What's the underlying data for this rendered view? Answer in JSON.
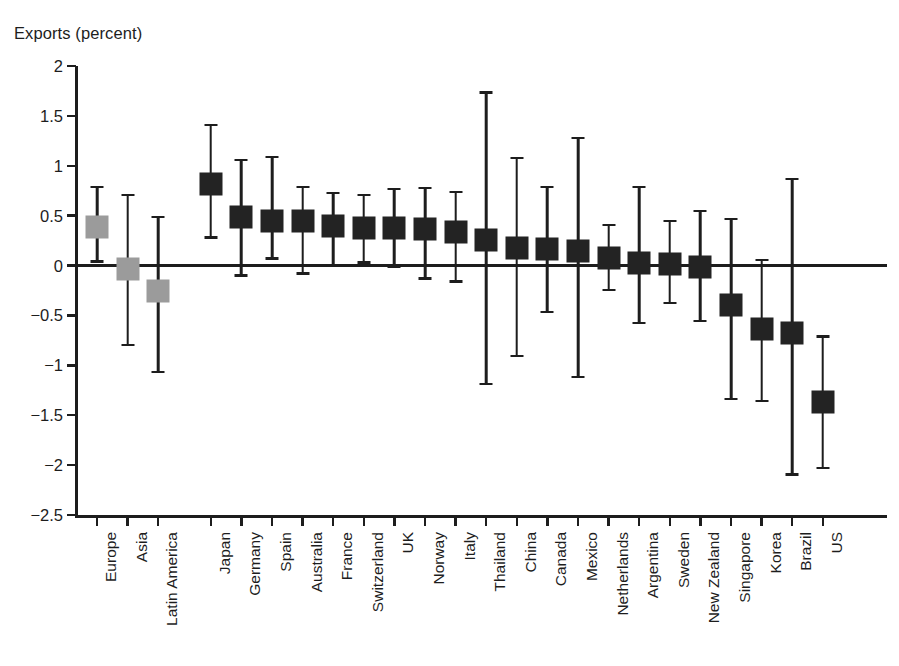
{
  "chart_data": {
    "type": "scatter",
    "title": "",
    "ylabel": "Exports (percent)",
    "xlabel": "",
    "ylim": [
      -2.5,
      2.0
    ],
    "ytick_labels": [
      "2",
      "1.5",
      "1",
      "0.5",
      "0",
      "−0.5",
      "−1",
      "−1.5",
      "−2",
      "−2.5"
    ],
    "ytick_values": [
      2,
      1.5,
      1,
      0.5,
      0,
      -0.5,
      -1,
      -1.5,
      -2,
      -2.5
    ],
    "grid": false,
    "legend": "none",
    "zero_line": true,
    "marker_style": "square-with-error-bars",
    "colors": {
      "aggregate_marker": "#9b9b9b",
      "country_marker": "#232323",
      "axis": "#1d1d1d"
    },
    "groups": [
      {
        "name": "aggregates",
        "color": "#9b9b9b"
      },
      {
        "name": "countries",
        "color": "#232323"
      }
    ],
    "categories": [
      "Europe",
      "Asia",
      "Latin America",
      "Japan",
      "Germany",
      "Spain",
      "Australia",
      "France",
      "Switzerland",
      "UK",
      "Norway",
      "Italy",
      "Thailand",
      "China",
      "Canada",
      "Mexico",
      "Netherlands",
      "Argentina",
      "Sweden",
      "New Zealand",
      "Singapore",
      "Korea",
      "Brazil",
      "US"
    ],
    "points": [
      {
        "label": "Europe",
        "group": "aggregates",
        "value": 0.39,
        "low": 0.03,
        "high": 0.8
      },
      {
        "label": "Asia",
        "group": "aggregates",
        "value": -0.03,
        "low": -0.81,
        "high": 0.72
      },
      {
        "label": "Latin America",
        "group": "aggregates",
        "value": -0.26,
        "low": -1.08,
        "high": 0.5
      },
      {
        "label": "Japan",
        "group": "countries",
        "value": 0.82,
        "low": 0.27,
        "high": 1.42
      },
      {
        "label": "Germany",
        "group": "countries",
        "value": 0.49,
        "low": -0.11,
        "high": 1.07
      },
      {
        "label": "Spain",
        "group": "countries",
        "value": 0.45,
        "low": 0.06,
        "high": 1.1
      },
      {
        "label": "Australia",
        "group": "countries",
        "value": 0.45,
        "low": -0.09,
        "high": 0.8
      },
      {
        "label": "France",
        "group": "countries",
        "value": 0.4,
        "low": -0.01,
        "high": 0.74
      },
      {
        "label": "Switzerland",
        "group": "countries",
        "value": 0.38,
        "low": 0.02,
        "high": 0.72
      },
      {
        "label": "UK",
        "group": "countries",
        "value": 0.38,
        "low": -0.02,
        "high": 0.78
      },
      {
        "label": "Norway",
        "group": "countries",
        "value": 0.37,
        "low": -0.14,
        "high": 0.79
      },
      {
        "label": "Italy",
        "group": "countries",
        "value": 0.34,
        "low": -0.17,
        "high": 0.75
      },
      {
        "label": "Thailand",
        "group": "countries",
        "value": 0.26,
        "low": -1.2,
        "high": 1.75
      },
      {
        "label": "China",
        "group": "countries",
        "value": 0.18,
        "low": -0.92,
        "high": 1.09
      },
      {
        "label": "Canada",
        "group": "countries",
        "value": 0.17,
        "low": -0.48,
        "high": 0.8
      },
      {
        "label": "Mexico",
        "group": "countries",
        "value": 0.15,
        "low": -1.13,
        "high": 1.29
      },
      {
        "label": "Netherlands",
        "group": "countries",
        "value": 0.08,
        "low": -0.26,
        "high": 0.42
      },
      {
        "label": "Argentina",
        "group": "countries",
        "value": 0.03,
        "low": -0.59,
        "high": 0.8
      },
      {
        "label": "Sweden",
        "group": "countries",
        "value": 0.02,
        "low": -0.39,
        "high": 0.46
      },
      {
        "label": "New Zealand",
        "group": "countries",
        "value": -0.01,
        "low": -0.57,
        "high": 0.56
      },
      {
        "label": "Singapore",
        "group": "countries",
        "value": -0.4,
        "low": -1.35,
        "high": 0.48
      },
      {
        "label": "Korea",
        "group": "countries",
        "value": -0.64,
        "low": -1.37,
        "high": 0.07
      },
      {
        "label": "Brazil",
        "group": "countries",
        "value": -0.68,
        "low": -2.11,
        "high": 0.88
      },
      {
        "label": "US",
        "group": "countries",
        "value": -1.37,
        "low": -2.04,
        "high": -0.7
      }
    ]
  }
}
